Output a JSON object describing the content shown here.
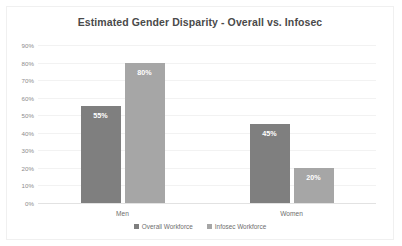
{
  "chart_data": {
    "type": "bar",
    "title": "Estimated Gender Disparity - Overall vs. Infosec",
    "xlabel": "",
    "ylabel": "",
    "categories": [
      "Men",
      "Women"
    ],
    "series": [
      {
        "name": "Overall Workforce",
        "color": "#7f7f7f",
        "values": [
          55,
          45
        ],
        "labels": [
          "55%",
          "20%"
        ]
      },
      {
        "name": "Infosec Workforce",
        "color": "#a6a6a6",
        "values": [
          80,
          20
        ],
        "labels": [
          "80%",
          "20%"
        ]
      }
    ],
    "bars": [
      {
        "category": "Men",
        "series": "Overall Workforce",
        "value": 55,
        "label": "55%",
        "color": "#7f7f7f"
      },
      {
        "category": "Men",
        "series": "Infosec Workforce",
        "value": 80,
        "label": "80%",
        "color": "#a6a6a6"
      },
      {
        "category": "Women",
        "series": "Overall Workforce",
        "value": 45,
        "label": "45%",
        "color": "#7f7f7f"
      },
      {
        "category": "Women",
        "series": "Infosec Workforce",
        "value": 20,
        "label": "20%",
        "color": "#a6a6a6"
      }
    ],
    "ylim": [
      0,
      90
    ],
    "ytick_labels": [
      "90%",
      "80%",
      "70%",
      "60%",
      "50%",
      "40%",
      "30%",
      "20%",
      "10%",
      "0%"
    ],
    "ytick_values": [
      90,
      80,
      70,
      60,
      50,
      40,
      30,
      20,
      10,
      0
    ],
    "grid": true,
    "legend_position": "bottom"
  },
  "legend": {
    "items": [
      {
        "label": "Overall Workforce",
        "color": "#7f7f7f"
      },
      {
        "label": "Infosec Workforce",
        "color": "#a6a6a6"
      }
    ]
  }
}
